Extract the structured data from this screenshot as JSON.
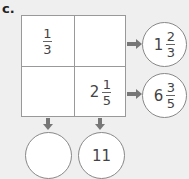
{
  "label": "c.",
  "grid": {
    "top_left": {
      "whole": "",
      "numerator": "1",
      "denominator": "3"
    },
    "top_right": {
      "whole": "",
      "numerator": "",
      "denominator": ""
    },
    "bottom_left": {
      "whole": "",
      "numerator": "",
      "denominator": ""
    },
    "bottom_right": {
      "whole": "2",
      "numerator": "1",
      "denominator": "5"
    }
  },
  "row_totals": [
    {
      "whole": "1",
      "numerator": "2",
      "denominator": "3"
    },
    {
      "whole": "6",
      "numerator": "3",
      "denominator": "5"
    }
  ],
  "column_totals": [
    {
      "value": ""
    },
    {
      "value": "11"
    }
  ],
  "colors": {
    "background": "#efefef",
    "border": "#999999",
    "arrow": "#777777"
  }
}
